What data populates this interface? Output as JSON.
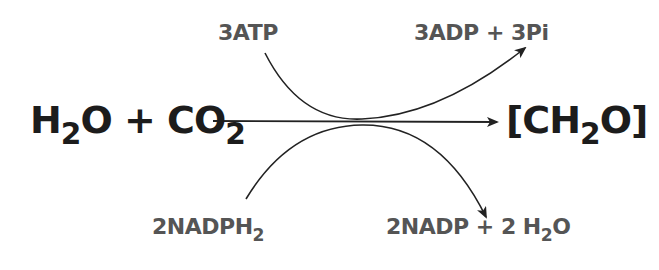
{
  "diagram": {
    "reactants": {
      "part1": "H",
      "sub1": "2",
      "part2": "O + CO",
      "sub2": "2"
    },
    "product": {
      "part1": "[CH",
      "sub1": "2",
      "part2": "O]"
    },
    "atp_input": "3ATP",
    "atp_output": "3ADP + 3Pi",
    "nadph_input": {
      "text": "2NADPH",
      "sub": "2"
    },
    "nadph_output": {
      "part1": "2NADP + 2 H",
      "sub1": "2",
      "part2": "O"
    },
    "colors": {
      "main_text": "#1c1c1c",
      "side_text": "#555555",
      "arrow": "#222222",
      "background": "#ffffff"
    }
  }
}
